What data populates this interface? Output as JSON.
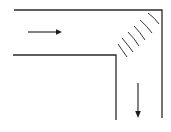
{
  "diagram": {
    "title": "",
    "colors": {
      "background": "#ffffff",
      "lines": "#2a2a2a"
    },
    "elements": {
      "flow_in": {
        "direction": "right",
        "icon": "arrow-right-icon"
      },
      "flow_out": {
        "direction": "down",
        "icon": "arrow-down-icon"
      },
      "wave_arcs": {
        "count": 6,
        "location": "outer corner of bend"
      }
    }
  }
}
